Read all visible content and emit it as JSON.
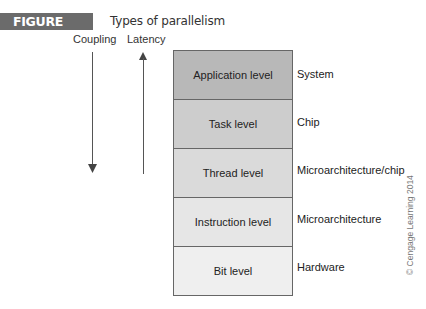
{
  "figure": {
    "badge": "FIGURE 13.1",
    "title": "Types of parallelism"
  },
  "axes": {
    "coupling": {
      "label": "Coupling",
      "direction": "down"
    },
    "latency": {
      "label": "Latency",
      "direction": "up"
    }
  },
  "levels": [
    {
      "label": "Application level",
      "scope": "System",
      "color": "#b8b8b8"
    },
    {
      "label": "Task level",
      "scope": "Chip",
      "color": "#cdcdcd"
    },
    {
      "label": "Thread level",
      "scope": "Microarchitecture/chip",
      "color": "#dadada"
    },
    {
      "label": "Instruction level",
      "scope": "Microarchitecture",
      "color": "#e6e6e6"
    },
    {
      "label": "Bit level",
      "scope": "Hardware",
      "color": "#efefef"
    }
  ],
  "copyright": "© Cengage Learning 2014"
}
